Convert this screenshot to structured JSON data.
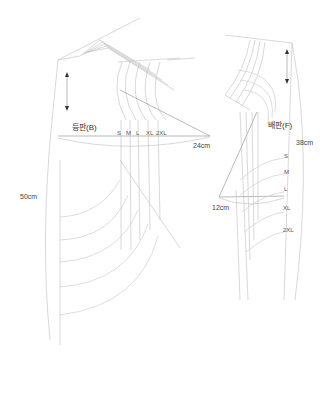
{
  "diagram": {
    "back_panel": {
      "title": "등판(B)",
      "width_label": "24cm",
      "length_label": "50cm",
      "sizes": [
        "S",
        "M",
        "L",
        "XL",
        "2XL"
      ]
    },
    "front_panel": {
      "title": "배판(F)",
      "width_label": "12cm",
      "length_label": "38cm",
      "sizes": [
        "S",
        "M",
        "L",
        "XL",
        "2XL"
      ]
    },
    "colors": {
      "line": "#bdbdbd",
      "dark_line": "#8a8a8a",
      "text": "#444444"
    }
  }
}
